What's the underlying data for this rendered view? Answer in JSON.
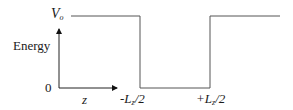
{
  "diagram": {
    "labels": {
      "potential": "V",
      "potential_sub": "o",
      "y_axis": "Energy",
      "zero": "0",
      "x_axis": "z",
      "left_edge_prefix": "-L",
      "left_edge_sub": "z",
      "left_edge_suffix": "/2",
      "right_edge_prefix": "+L",
      "right_edge_sub": "z",
      "right_edge_suffix": "/2"
    },
    "line_color": "#555555"
  }
}
